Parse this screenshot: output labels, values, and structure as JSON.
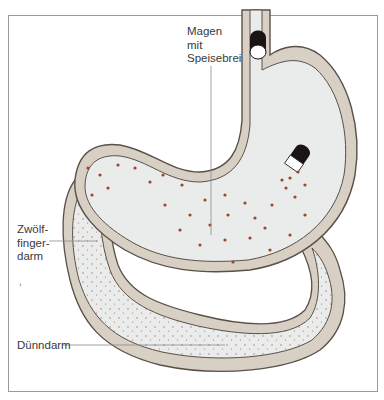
{
  "diagram": {
    "type": "anatomical illustration",
    "labels": {
      "stomach": [
        "Magen",
        "mit",
        "Speisebrei"
      ],
      "duodenum": [
        "Zwölf-",
        "finger-",
        "darm"
      ],
      "small_intestine": "Dünndarm"
    },
    "stray_mark": ",",
    "colors": {
      "wall": "#d8d0c4",
      "outline": "#5a5048",
      "lumen": "#e9ecea",
      "chyme_dots": "#a0442a",
      "sphincter": "#1a1414",
      "frame": "#9a9a9a",
      "leader_lines": "#8a8a8a"
    }
  }
}
